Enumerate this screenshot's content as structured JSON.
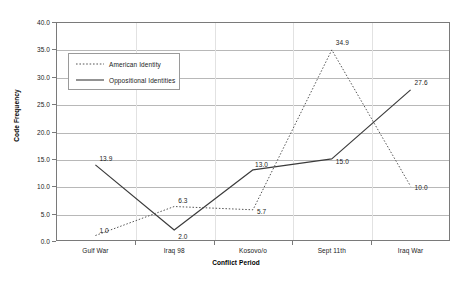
{
  "chart_data": {
    "type": "line",
    "title": "",
    "xlabel": "Conflict Period",
    "ylabel": "Code Frequency",
    "categories": [
      "Gulf War",
      "Iraq 98",
      "Kosovo/o",
      "Sept 11th",
      "Iraq War"
    ],
    "ylim": [
      0.0,
      40.0
    ],
    "yticks": [
      "0.0",
      "5.0",
      "10.0",
      "15.0",
      "20.0",
      "25.0",
      "30.0",
      "35.0",
      "40.0"
    ],
    "ytick_values": [
      0.0,
      5.0,
      10.0,
      15.0,
      20.0,
      25.0,
      30.0,
      35.0,
      40.0
    ],
    "grid": true,
    "legend_position": "upper-left-inside",
    "series": [
      {
        "name": "American Identity",
        "style": "dotted",
        "color": "#555555",
        "values": [
          1.0,
          6.3,
          5.7,
          34.9,
          10.0
        ],
        "labels": [
          "1.0",
          "6.3",
          "5.7",
          "34.9",
          "10.0"
        ]
      },
      {
        "name": "Oppositional Identities",
        "style": "solid",
        "color": "#3b3b3b",
        "values": [
          13.9,
          2.0,
          13.0,
          15.0,
          27.6
        ],
        "labels": [
          "13.9",
          "2.0",
          "13.0",
          "15.0",
          "27.6"
        ]
      }
    ]
  },
  "legend": {
    "items": [
      {
        "label": "American Identity"
      },
      {
        "label": "Oppositional Identities"
      }
    ]
  }
}
